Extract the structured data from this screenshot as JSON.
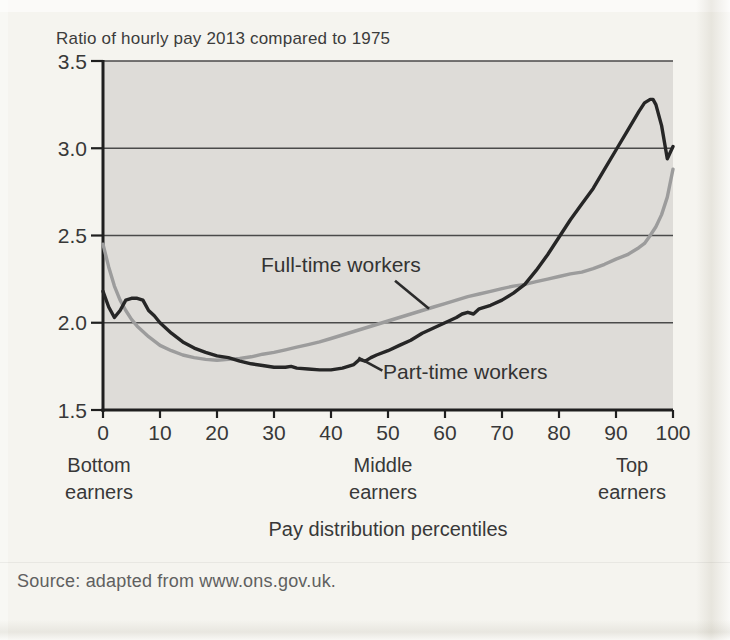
{
  "page": {
    "title": "Ratio of hourly pay 2013 compared to 1975",
    "xlabel": "Pay distribution percentiles",
    "source": "Source: adapted from www.ons.gov.uk.",
    "group_labels": [
      {
        "line1": "Bottom",
        "line2": "earners"
      },
      {
        "line1": "Middle",
        "line2": "earners"
      },
      {
        "line1": "Top",
        "line2": "earners"
      }
    ]
  },
  "colors": {
    "page_bg": "#f5f4ef",
    "plot_bg": "#dedcd8",
    "grid": "#4a4a4a",
    "axis": "#1f1f1f",
    "text": "#383838",
    "full_time": "#9c9c9c",
    "part_time": "#262626",
    "leader": "#2b2b2b"
  },
  "chart_data": {
    "type": "line",
    "title": "Ratio of hourly pay 2013 compared to 1975",
    "xlabel": "Pay distribution percentiles",
    "ylabel": "",
    "xlim": [
      0,
      100
    ],
    "ylim": [
      1.5,
      3.5
    ],
    "x_ticks": [
      0,
      10,
      20,
      30,
      40,
      50,
      60,
      70,
      80,
      90,
      100
    ],
    "y_ticks": [
      1.5,
      2.0,
      2.5,
      3.0,
      3.5
    ],
    "y_tick_labels": [
      "1.5",
      "2.0",
      "2.5",
      "3.0",
      "3.5"
    ],
    "grid": "horizontal",
    "legend_position": "inline-annotations",
    "x_region_labels": [
      {
        "label": "Bottom earners",
        "x": 0
      },
      {
        "label": "Middle earners",
        "x": 49
      },
      {
        "label": "Top earners",
        "x": 93
      }
    ],
    "series": [
      {
        "name": "Full-time workers",
        "color": "#9c9c9c",
        "points": [
          [
            0,
            2.45
          ],
          [
            1,
            2.32
          ],
          [
            2,
            2.21
          ],
          [
            3,
            2.13
          ],
          [
            4,
            2.07
          ],
          [
            5,
            2.02
          ],
          [
            6,
            1.98
          ],
          [
            7,
            1.95
          ],
          [
            8,
            1.92
          ],
          [
            10,
            1.87
          ],
          [
            12,
            1.84
          ],
          [
            14,
            1.815
          ],
          [
            16,
            1.8
          ],
          [
            18,
            1.79
          ],
          [
            20,
            1.785
          ],
          [
            22,
            1.79
          ],
          [
            24,
            1.795
          ],
          [
            26,
            1.805
          ],
          [
            28,
            1.82
          ],
          [
            30,
            1.83
          ],
          [
            32,
            1.845
          ],
          [
            34,
            1.86
          ],
          [
            36,
            1.875
          ],
          [
            38,
            1.89
          ],
          [
            40,
            1.91
          ],
          [
            42,
            1.93
          ],
          [
            44,
            1.95
          ],
          [
            46,
            1.97
          ],
          [
            48,
            1.99
          ],
          [
            50,
            2.01
          ],
          [
            52,
            2.03
          ],
          [
            54,
            2.05
          ],
          [
            56,
            2.07
          ],
          [
            58,
            2.09
          ],
          [
            60,
            2.11
          ],
          [
            62,
            2.13
          ],
          [
            64,
            2.15
          ],
          [
            66,
            2.165
          ],
          [
            68,
            2.18
          ],
          [
            70,
            2.195
          ],
          [
            72,
            2.21
          ],
          [
            74,
            2.22
          ],
          [
            76,
            2.235
          ],
          [
            78,
            2.25
          ],
          [
            80,
            2.265
          ],
          [
            82,
            2.28
          ],
          [
            84,
            2.29
          ],
          [
            86,
            2.31
          ],
          [
            88,
            2.335
          ],
          [
            90,
            2.365
          ],
          [
            92,
            2.39
          ],
          [
            94,
            2.43
          ],
          [
            95,
            2.455
          ],
          [
            96,
            2.5
          ],
          [
            97,
            2.55
          ],
          [
            98,
            2.62
          ],
          [
            99,
            2.72
          ],
          [
            100,
            2.88
          ]
        ]
      },
      {
        "name": "Part-time workers",
        "color": "#262626",
        "points": [
          [
            0,
            2.18
          ],
          [
            1,
            2.09
          ],
          [
            2,
            2.03
          ],
          [
            3,
            2.07
          ],
          [
            4,
            2.13
          ],
          [
            5,
            2.14
          ],
          [
            6,
            2.14
          ],
          [
            7,
            2.13
          ],
          [
            8,
            2.07
          ],
          [
            9,
            2.04
          ],
          [
            10,
            2.0
          ],
          [
            12,
            1.94
          ],
          [
            14,
            1.89
          ],
          [
            16,
            1.855
          ],
          [
            18,
            1.83
          ],
          [
            20,
            1.81
          ],
          [
            22,
            1.8
          ],
          [
            24,
            1.78
          ],
          [
            26,
            1.765
          ],
          [
            28,
            1.755
          ],
          [
            30,
            1.745
          ],
          [
            32,
            1.745
          ],
          [
            33,
            1.75
          ],
          [
            34,
            1.74
          ],
          [
            36,
            1.735
          ],
          [
            38,
            1.73
          ],
          [
            40,
            1.73
          ],
          [
            42,
            1.74
          ],
          [
            44,
            1.76
          ],
          [
            45,
            1.79
          ],
          [
            46,
            1.78
          ],
          [
            47,
            1.8
          ],
          [
            48,
            1.815
          ],
          [
            50,
            1.84
          ],
          [
            52,
            1.87
          ],
          [
            54,
            1.9
          ],
          [
            56,
            1.94
          ],
          [
            58,
            1.97
          ],
          [
            60,
            2.0
          ],
          [
            62,
            2.03
          ],
          [
            63,
            2.05
          ],
          [
            64,
            2.06
          ],
          [
            65,
            2.05
          ],
          [
            66,
            2.08
          ],
          [
            68,
            2.1
          ],
          [
            70,
            2.13
          ],
          [
            72,
            2.17
          ],
          [
            74,
            2.22
          ],
          [
            76,
            2.3
          ],
          [
            78,
            2.39
          ],
          [
            80,
            2.49
          ],
          [
            82,
            2.59
          ],
          [
            84,
            2.68
          ],
          [
            86,
            2.77
          ],
          [
            88,
            2.88
          ],
          [
            90,
            2.99
          ],
          [
            92,
            3.1
          ],
          [
            94,
            3.21
          ],
          [
            95,
            3.26
          ],
          [
            96,
            3.28
          ],
          [
            96.5,
            3.28
          ],
          [
            97,
            3.25
          ],
          [
            98,
            3.13
          ],
          [
            99,
            2.94
          ],
          [
            100,
            3.01
          ]
        ]
      }
    ],
    "annotations": [
      {
        "id": "full-time",
        "text": "Full-time workers",
        "anchor_x": 57.2,
        "anchor_value": 2.08,
        "leader_dx": -34,
        "leader_dy": -28
      },
      {
        "id": "part-time",
        "text": "Part-time workers",
        "anchor_x": 44.8,
        "anchor_value": 1.8,
        "leader_dx": 24,
        "leader_dy": 13
      }
    ]
  }
}
